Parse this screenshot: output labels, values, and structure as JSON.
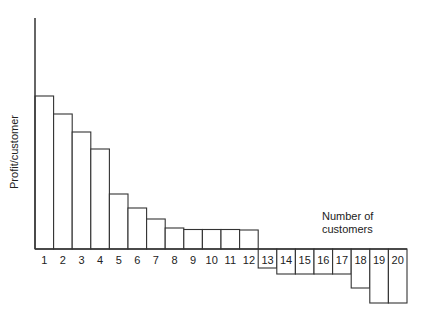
{
  "chart_data": {
    "type": "bar",
    "title": "",
    "xlabel": "Number of customers",
    "xlabel_lines": [
      "Number of",
      "customers"
    ],
    "ylabel": "Profit/customer",
    "categories": [
      "1",
      "2",
      "3",
      "4",
      "5",
      "6",
      "7",
      "8",
      "9",
      "10",
      "11",
      "12",
      "13",
      "14",
      "15",
      "16",
      "17",
      "18",
      "19",
      "20"
    ],
    "values": [
      153,
      135,
      117,
      100,
      55,
      41,
      30,
      21,
      19.5,
      19.5,
      19.5,
      19,
      -19,
      -25,
      -25,
      -25,
      -25,
      -39,
      -54,
      -54
    ],
    "ylim": [
      -60,
      231
    ],
    "grid": false,
    "legend": null
  },
  "colors": {
    "stroke": "#333333",
    "fill": "#ffffff"
  }
}
